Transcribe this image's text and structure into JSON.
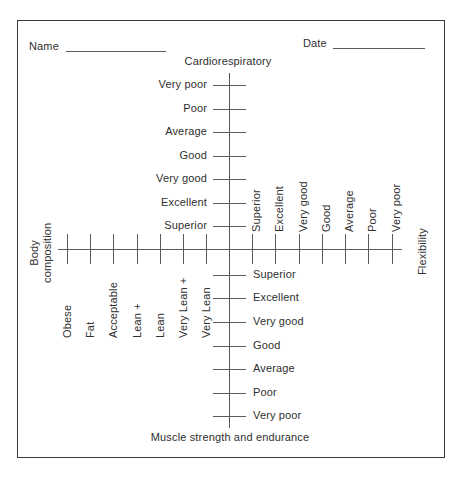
{
  "form": {
    "name_label": "Name",
    "date_label": "Date"
  },
  "axes": {
    "cardio": {
      "title": "Cardiorespiratory",
      "labels": [
        "Very poor",
        "Poor",
        "Average",
        "Good",
        "Very good",
        "Excellent",
        "Superior"
      ]
    },
    "muscle": {
      "title": "Muscle strength and endurance",
      "labels": [
        "Superior",
        "Excellent",
        "Very good",
        "Good",
        "Average",
        "Poor",
        "Very poor"
      ]
    },
    "body_composition": {
      "title_line1": "Body",
      "title_line2": "composition",
      "labels": [
        "Obese",
        "Fat",
        "Acceptable",
        "Lean +",
        "Lean",
        "Very Lean +",
        "Very Lean"
      ]
    },
    "flexibility": {
      "title": "Flexibility",
      "labels": [
        "Superior",
        "Excellent",
        "Very good",
        "Good",
        "Average",
        "Poor",
        "Very poor"
      ]
    }
  },
  "colors": {
    "ink": "#2f2f2f",
    "line": "#5a5a5a",
    "border": "#3a3a3a",
    "background": "#ffffff"
  }
}
